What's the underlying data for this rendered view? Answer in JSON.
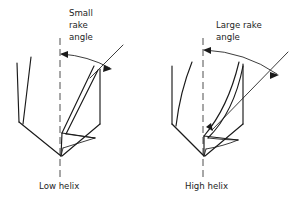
{
  "figure": {
    "background_color": "#ffffff",
    "ink_color": "#1a1a1a"
  },
  "left_drill": {
    "caption": "Low helix",
    "annotation_lines": [
      "Small",
      "rake",
      "angle"
    ],
    "annotation_full": "Small rake angle",
    "centerline_label": "drill axis centerline",
    "arrow_kind": "double-headed-arc"
  },
  "right_drill": {
    "caption": "High helix",
    "annotation_lines": [
      "Large rake",
      "angle"
    ],
    "annotation_full": "Large rake angle",
    "centerline_label": "drill axis centerline",
    "arrow_kind": "double-headed-arc"
  }
}
